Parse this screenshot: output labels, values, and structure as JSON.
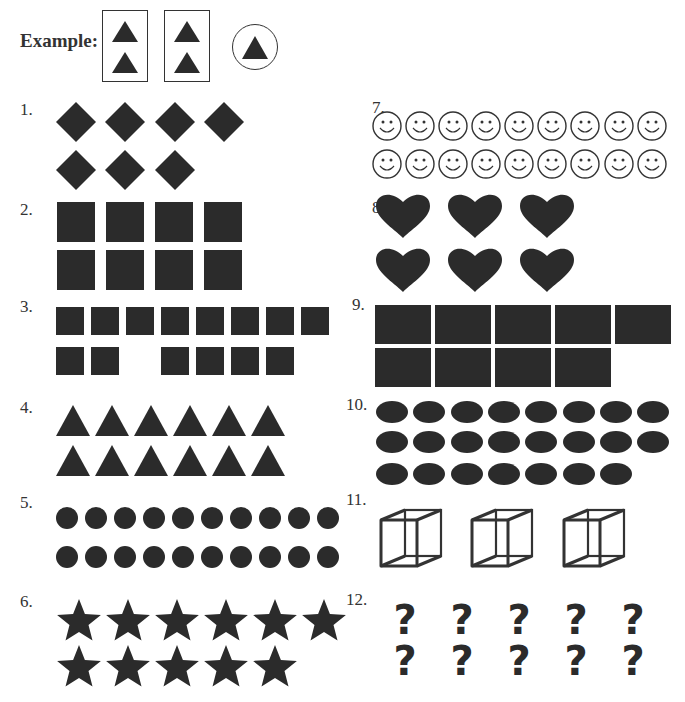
{
  "example": {
    "label": "Example:",
    "groups": [
      {
        "type": "box",
        "shape": "triangle",
        "count": 2
      },
      {
        "type": "box",
        "shape": "triangle",
        "count": 2
      },
      {
        "type": "circle",
        "shape": "triangle",
        "count": 1
      }
    ]
  },
  "problems": [
    {
      "number": "1.",
      "shape": "diamond",
      "rows": [
        4,
        3
      ],
      "total": 7
    },
    {
      "number": "2.",
      "shape": "square",
      "rows": [
        4,
        4
      ],
      "total": 8
    },
    {
      "number": "3.",
      "shape": "small-square",
      "rows": [
        8,
        6
      ],
      "layout_note": "second row: 2 squares, gap, 4 squares",
      "total": 14
    },
    {
      "number": "4.",
      "shape": "triangle",
      "rows": [
        6,
        6
      ],
      "total": 12
    },
    {
      "number": "5.",
      "shape": "circle",
      "rows": [
        10,
        10
      ],
      "total": 20
    },
    {
      "number": "6.",
      "shape": "star",
      "rows": [
        6,
        5
      ],
      "total": 11
    },
    {
      "number": "7.",
      "shape": "smiley-face",
      "rows": [
        9,
        9
      ],
      "total": 18
    },
    {
      "number": "8.",
      "shape": "heart",
      "rows": [
        3,
        3
      ],
      "total": 6
    },
    {
      "number": "9.",
      "shape": "rectangle",
      "rows": [
        5,
        4
      ],
      "total": 9
    },
    {
      "number": "10.",
      "shape": "oval",
      "rows": [
        8,
        8,
        7
      ],
      "total": 23
    },
    {
      "number": "11.",
      "shape": "wireframe-cube",
      "rows": [
        3
      ],
      "total": 3
    },
    {
      "number": "12.",
      "shape": "question-mark",
      "rows": [
        5,
        5
      ],
      "total": 10
    }
  ],
  "colors": {
    "fill": "#2b2b2b",
    "stroke": "#333333",
    "background": "#ffffff"
  }
}
